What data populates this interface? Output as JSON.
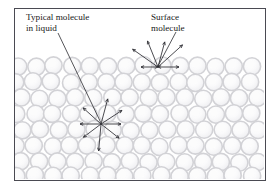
{
  "figure": {
    "background_color": "#ffffff",
    "border_color": "#4a4a52",
    "border_width": 1,
    "frame": {
      "x": 14,
      "y": 8,
      "width": 251,
      "height": 172
    }
  },
  "labels": [
    {
      "name": "typical-molecule-label",
      "line1": "Typical molecule",
      "line2": "in liquid",
      "x": 26,
      "y": 20,
      "line_height": 11,
      "leader": {
        "x1": 58,
        "y1": 33,
        "x2": 101,
        "y2": 123
      }
    },
    {
      "name": "surface-molecule-label",
      "line1": "Surface",
      "line2": "molecule",
      "x": 151,
      "y": 20,
      "line_height": 11,
      "leader": {
        "x1": 176,
        "y1": 32,
        "x2": 158,
        "y2": 66
      }
    }
  ],
  "liquid": {
    "top_surface_y": 57,
    "bottom_y": 179,
    "left_x": 15,
    "right_x": 264,
    "molecule": {
      "radius": 8.6,
      "ring_color": "#d2d2d6",
      "fill_color": "#f2f2f4",
      "highlight_color": "#fbfbfc",
      "ring_width": 1.6
    },
    "rows": [
      {
        "y": 66,
        "x_start": 18,
        "spacing": 18.0,
        "count": 14,
        "jitter": 0
      },
      {
        "y": 82,
        "x_start": 16,
        "spacing": 18.0,
        "count": 14,
        "jitter": 1
      },
      {
        "y": 98,
        "x_start": 21,
        "spacing": 18.2,
        "count": 14,
        "jitter": 0
      },
      {
        "y": 114,
        "x_start": 17,
        "spacing": 18.0,
        "count": 14,
        "jitter": 1
      },
      {
        "y": 130,
        "x_start": 22,
        "spacing": 18.2,
        "count": 14,
        "jitter": 0
      },
      {
        "y": 146,
        "x_start": 16,
        "spacing": 18.0,
        "count": 14,
        "jitter": 1
      },
      {
        "y": 162,
        "x_start": 21,
        "spacing": 18.2,
        "count": 14,
        "jitter": 0
      },
      {
        "y": 176,
        "x_start": 17,
        "spacing": 18.0,
        "count": 14,
        "jitter": 1
      }
    ]
  },
  "force_diagrams": [
    {
      "name": "surface-molecule-forces",
      "center_x": 158,
      "center_y": 67,
      "arrow_color": "#2b2b30",
      "arrow_width": 0.85,
      "head_size": 3.0,
      "description": "Unbalanced net inward force on a surface molecule",
      "arrows": [
        {
          "angle_deg": 180,
          "length": 17,
          "double_headed": true
        },
        {
          "angle_deg": 0,
          "length": 21,
          "double_headed": true
        },
        {
          "angle_deg": 215,
          "length": 31,
          "double_headed": false
        },
        {
          "angle_deg": 248,
          "length": 28,
          "double_headed": false
        },
        {
          "angle_deg": 285,
          "length": 26,
          "double_headed": false
        },
        {
          "angle_deg": 318,
          "length": 33,
          "double_headed": false
        }
      ]
    },
    {
      "name": "typical-molecule-forces",
      "center_x": 101,
      "center_y": 124,
      "arrow_color": "#2b2b30",
      "arrow_width": 0.85,
      "head_size": 3.0,
      "description": "Balanced forces on a molecule in the bulk liquid",
      "arrows": [
        {
          "angle_deg": 180,
          "length": 21,
          "double_headed": false
        },
        {
          "angle_deg": 143,
          "length": 22,
          "double_headed": false
        },
        {
          "angle_deg": 95,
          "length": 27,
          "double_headed": false
        },
        {
          "angle_deg": 38,
          "length": 23,
          "double_headed": false
        },
        {
          "angle_deg": 0,
          "length": 20,
          "double_headed": false
        },
        {
          "angle_deg": 327,
          "length": 25,
          "double_headed": false
        },
        {
          "angle_deg": 285,
          "length": 26,
          "double_headed": false
        },
        {
          "angle_deg": 222,
          "length": 24,
          "double_headed": false
        }
      ]
    }
  ]
}
